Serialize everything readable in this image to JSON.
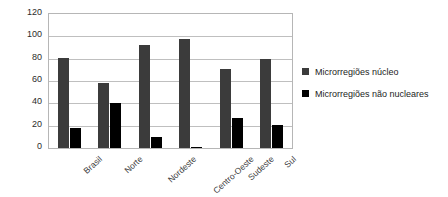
{
  "chart_data": {
    "type": "bar",
    "title": "",
    "subtitle": "",
    "xlabel": "",
    "ylabel": "",
    "categories": [
      "Brasil",
      "Norte",
      "Nordeste",
      "Centro-Oeste",
      "Sudeste",
      "Sul"
    ],
    "series": [
      {
        "name": "Microrregiões núcleo",
        "color": "#3b3b3b",
        "values": [
          81,
          58,
          92,
          98,
          71,
          80
        ]
      },
      {
        "name": "Microrregiões não nucleares",
        "color": "#000000",
        "values": [
          18,
          40,
          10,
          1,
          27,
          21
        ]
      }
    ],
    "ylim": [
      0,
      120
    ],
    "ytick_values": [
      0,
      20,
      40,
      60,
      80,
      100,
      120
    ],
    "ytick_labels": [
      "0",
      "20",
      "40",
      "60",
      "80",
      "100",
      "120"
    ],
    "grid": true,
    "grid_axis": "y",
    "legend_position": "right",
    "legend": [
      {
        "label": "Microrregiões núcleo",
        "swatch": "legend-swatch-core"
      },
      {
        "label": "Microrregiões não nucleares",
        "swatch": "legend-swatch-non-nuclear"
      }
    ]
  }
}
